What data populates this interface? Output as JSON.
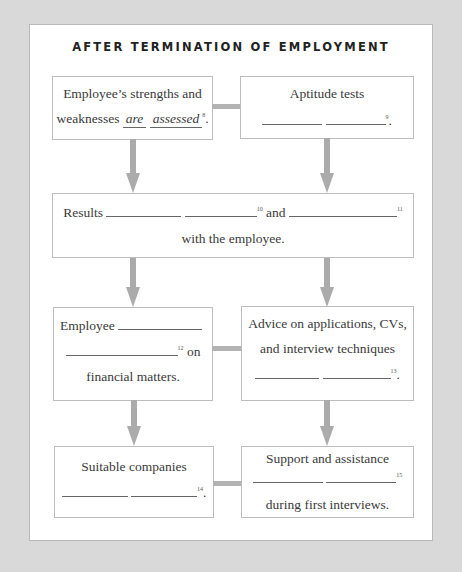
{
  "title": "AFTER TERMINATION OF EMPLOYMENT",
  "boxes": {
    "strengths": {
      "line1": "Employee’s strengths and",
      "line2_prefix": "weaknesses",
      "answer1": "are",
      "answer2": "assessed",
      "number": "8",
      "suffix": "."
    },
    "aptitude": {
      "line1": "Aptitude tests",
      "number": "9",
      "suffix": "."
    },
    "results": {
      "prefix": "Results",
      "number1": "10",
      "middle": "and",
      "number2": "11",
      "line2": "with the employee."
    },
    "employee_financial": {
      "prefix": "Employee",
      "number": "12",
      "after_number": "on",
      "line3": "financial matters."
    },
    "advice": {
      "line1": "Advice on applications, CVs,",
      "line2": "and interview techniques",
      "number": "13",
      "suffix": "."
    },
    "companies": {
      "line1": "Suitable companies",
      "number": "14",
      "suffix": "."
    },
    "support": {
      "line1": "Support and assistance",
      "number": "15",
      "line3": "during first interviews."
    }
  },
  "colors": {
    "background": "#d9d9d9",
    "panel": "#ffffff",
    "connector": "#ababab",
    "box_border": "#bdbdbd"
  }
}
